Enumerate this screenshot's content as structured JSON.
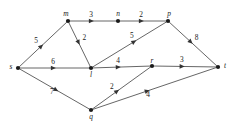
{
  "figure": {
    "kind": "weighted-directed-graph",
    "background_color": "#ffffff",
    "edge_color": "#555555",
    "node_color": "#1a1a1a",
    "label_color": "#1a1a1a"
  },
  "chart_data": {
    "type": "diagram",
    "title": "",
    "xlabel": "",
    "ylabel": "",
    "directed": true,
    "weighted": true,
    "nodes": [
      {
        "id": "s",
        "label": "s",
        "x": 18,
        "y": 68,
        "label_dx": -7,
        "label_dy": 1
      },
      {
        "id": "m",
        "label": "m",
        "x": 68,
        "y": 21,
        "label_dx": -2,
        "label_dy": -5
      },
      {
        "id": "n",
        "label": "n",
        "x": 118,
        "y": 21,
        "label_dx": 0,
        "label_dy": -5
      },
      {
        "id": "p",
        "label": "p",
        "x": 168,
        "y": 21,
        "label_dx": 1,
        "label_dy": -5
      },
      {
        "id": "l",
        "label": "l",
        "x": 91,
        "y": 68,
        "label_dx": 0,
        "label_dy": 9
      },
      {
        "id": "r",
        "label": "r",
        "x": 152,
        "y": 66,
        "label_dx": 0,
        "label_dy": -3
      },
      {
        "id": "t",
        "label": "t",
        "x": 218,
        "y": 67,
        "label_dx": 7,
        "label_dy": 1
      },
      {
        "id": "q",
        "label": "q",
        "x": 91,
        "y": 110,
        "label_dx": 0,
        "label_dy": 9
      }
    ],
    "edges": [
      {
        "from": "s",
        "to": "m",
        "weight": 5,
        "label_pos": 0.46,
        "label_off_x": -5,
        "label_off_y": -3
      },
      {
        "from": "m",
        "to": "n",
        "weight": 3,
        "label_pos": 0.46,
        "label_off_x": 0,
        "label_off_y": -4
      },
      {
        "from": "n",
        "to": "p",
        "weight": 2,
        "label_pos": 0.46,
        "label_off_x": 0,
        "label_off_y": -4
      },
      {
        "from": "m",
        "to": "l",
        "weight": 2,
        "label_pos": 0.45,
        "label_off_x": 6,
        "label_off_y": -2
      },
      {
        "from": "s",
        "to": "l",
        "weight": 6,
        "label_pos": 0.48,
        "label_off_x": 0,
        "label_off_y": -4
      },
      {
        "from": "l",
        "to": "p",
        "weight": 5,
        "label_pos": 0.56,
        "label_off_x": -2,
        "label_off_y": -4
      },
      {
        "from": "l",
        "to": "r",
        "weight": 4,
        "label_pos": 0.44,
        "label_off_x": 0,
        "label_off_y": -4
      },
      {
        "from": "r",
        "to": "t",
        "weight": 3,
        "label_pos": 0.45,
        "label_off_x": 0,
        "label_off_y": -4
      },
      {
        "from": "p",
        "to": "t",
        "weight": 8,
        "label_pos": 0.45,
        "label_off_x": 6,
        "label_off_y": -2
      },
      {
        "from": "s",
        "to": "q",
        "weight": 7,
        "label_pos": 0.52,
        "label_off_x": -4,
        "label_off_y": 4
      },
      {
        "from": "q",
        "to": "r",
        "weight": 2,
        "label_pos": 0.42,
        "label_off_x": -5,
        "label_off_y": -2
      },
      {
        "from": "q",
        "to": "t",
        "weight": 4,
        "label_pos": 0.44,
        "label_off_x": 1,
        "label_off_y": 6
      }
    ]
  }
}
